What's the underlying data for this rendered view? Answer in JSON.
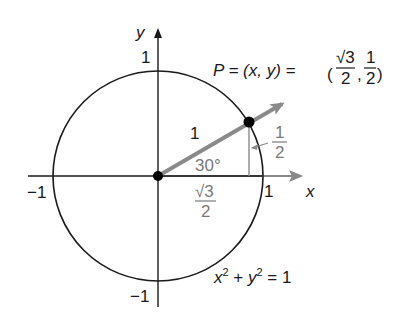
{
  "diagram": {
    "axes": {
      "x_label": "x",
      "y_label": "y",
      "tick_pos_x": "1",
      "tick_neg_x": "−1",
      "tick_pos_y": "1",
      "tick_neg_y": "−1"
    },
    "point": {
      "label_prefix": "P = (x, y) = ",
      "x_num": "√3",
      "x_den": "2",
      "y_num": "1",
      "y_den": "2"
    },
    "radius_label": "1",
    "angle_label": "30°",
    "opposite_label": {
      "num": "1",
      "den": "2"
    },
    "adjacent_label": {
      "num": "√3",
      "den": "2"
    },
    "equation": {
      "x": "x",
      "x_exp": "2",
      "plus": " + ",
      "y": "y",
      "y_exp": "2",
      "rhs": " = 1"
    },
    "colors": {
      "axis": "#1a1a1a",
      "circle": "#1a1a1a",
      "ray": "#8a8a8a",
      "label_gray": "#7a7a7a",
      "point": "#000000"
    }
  }
}
